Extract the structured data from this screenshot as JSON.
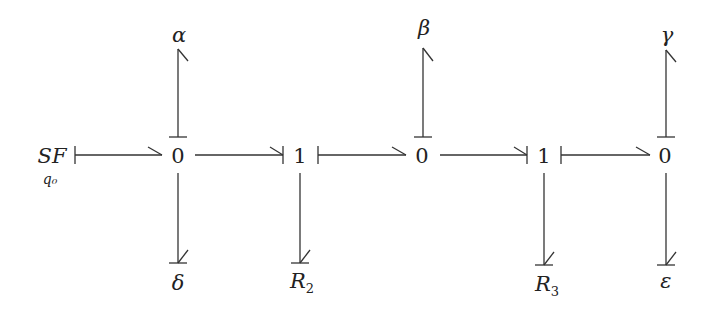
{
  "diagram": {
    "type": "bond-graph",
    "source": {
      "label": "SF",
      "subscript": "q0",
      "subscript_display": "q₀"
    },
    "junctions": [
      {
        "id": "j1",
        "label": "0",
        "x": 178
      },
      {
        "id": "j2",
        "label": "1",
        "x": 300
      },
      {
        "id": "j3",
        "label": "0",
        "x": 422
      },
      {
        "id": "j4",
        "label": "1",
        "x": 544
      },
      {
        "id": "j5",
        "label": "0",
        "x": 665
      }
    ],
    "top_elements": [
      {
        "junction": "j1",
        "label": "α"
      },
      {
        "junction": "j3",
        "label": "β"
      },
      {
        "junction": "j5",
        "label": "γ"
      }
    ],
    "bottom_elements": [
      {
        "junction": "j1",
        "label": "δ"
      },
      {
        "junction": "j2",
        "label": "R",
        "subscript": "2"
      },
      {
        "junction": "j4",
        "label": "R",
        "subscript": "3"
      },
      {
        "junction": "j5",
        "label": "ε"
      }
    ],
    "bonds": [
      {
        "from": "SF",
        "to": "j1",
        "direction": "right",
        "causal_stroke": "start"
      },
      {
        "from": "j1",
        "to": "j2",
        "direction": "right",
        "causal_stroke": "end"
      },
      {
        "from": "j2",
        "to": "j3",
        "direction": "right",
        "causal_stroke": "start"
      },
      {
        "from": "j3",
        "to": "j4",
        "direction": "right",
        "causal_stroke": "end"
      },
      {
        "from": "j4",
        "to": "j5",
        "direction": "right",
        "causal_stroke": "start"
      },
      {
        "from": "j1",
        "to": "α",
        "direction": "up",
        "causal_stroke": "start"
      },
      {
        "from": "j3",
        "to": "β",
        "direction": "up",
        "causal_stroke": "start"
      },
      {
        "from": "j5",
        "to": "γ",
        "direction": "up",
        "causal_stroke": "start"
      },
      {
        "from": "j1",
        "to": "δ",
        "direction": "down",
        "causal_stroke": "end"
      },
      {
        "from": "j2",
        "to": "R2",
        "direction": "down",
        "causal_stroke": "end"
      },
      {
        "from": "j4",
        "to": "R3",
        "direction": "down",
        "causal_stroke": "end"
      },
      {
        "from": "j5",
        "to": "ε",
        "direction": "down",
        "causal_stroke": "end"
      }
    ],
    "colors": {
      "stroke": "#333333",
      "text": "#222222",
      "background": "#ffffff"
    }
  }
}
